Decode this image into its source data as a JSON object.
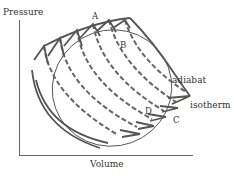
{
  "diagram": {
    "type": "pv-diagram",
    "axes": {
      "x_label": "Volume",
      "y_label": "Pressure"
    },
    "points": {
      "A": "A",
      "B": "B",
      "C": "C",
      "D": "D"
    },
    "curve_labels": {
      "adiabat": "adiabat",
      "isotherm": "isotherm"
    },
    "colors": {
      "stroke": "#555555",
      "text": "#333333",
      "axis": "#666666",
      "background": "#ffffff"
    },
    "legend": [
      {
        "style": "solid",
        "meaning": "adiabat"
      },
      {
        "style": "dashed",
        "meaning": "isotherm"
      }
    ]
  }
}
